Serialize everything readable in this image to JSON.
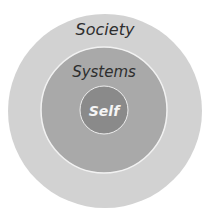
{
  "diagram": {
    "type": "concentric-circles",
    "rings": [
      {
        "label": "Society",
        "fill": "#d2d2d2",
        "cx": 105,
        "cy": 111,
        "r": 97
      },
      {
        "label": "Systems",
        "fill": "#a9a9a9",
        "cx": 104,
        "cy": 110,
        "r": 63
      },
      {
        "label": "Self",
        "fill": "#8a8a8a",
        "cx": 104,
        "cy": 110,
        "r": 24
      }
    ],
    "colors": {
      "stroke": "#f2f2f2",
      "text_dark": "#2e2e2e",
      "text_light": "#f5f5f5"
    }
  }
}
